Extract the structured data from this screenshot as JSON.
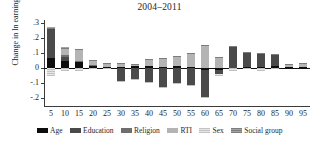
{
  "chart_data": {
    "type": "bar",
    "stacked": true,
    "title": "2004–2011",
    "xlabel": "",
    "ylabel": "Change in ln earnings",
    "categories": [
      "5",
      "10",
      "15",
      "20",
      "25",
      "30",
      "35",
      "40",
      "45",
      "50",
      "55",
      "60",
      "65",
      "70",
      "75",
      "80",
      "85",
      "90",
      "95"
    ],
    "ylim": [
      -0.25,
      0.32
    ],
    "yticks": [
      ".3",
      ".2",
      ".1",
      "0",
      "-.1",
      "-.2"
    ],
    "ytick_values": [
      0.3,
      0.2,
      0.1,
      0,
      -0.1,
      -0.2
    ],
    "grid": false,
    "legend_position": "bottom",
    "series": [
      {
        "name": "Age",
        "color": "#0d0d0d",
        "values": [
          0.065,
          0.045,
          0.04,
          0.02,
          0.008,
          0.006,
          0.014,
          0.018,
          0.011,
          0.013,
          0.01,
          -0.01,
          -0.011,
          0.004,
          0.006,
          0.011,
          0.014,
          0.006,
          0.009
        ]
      },
      {
        "name": "Education",
        "color": "#4a4a4a",
        "values": [
          0.195,
          0.03,
          0.0,
          0.0,
          0.0,
          -0.085,
          -0.068,
          -0.09,
          -0.125,
          -0.095,
          -0.112,
          -0.18,
          -0.03,
          0.142,
          0.096,
          0.084,
          0.077,
          0.0,
          0.0
        ]
      },
      {
        "name": "Religion",
        "color": "#6e6e6e",
        "values": [
          0.0,
          0.012,
          0.008,
          0.004,
          0.0,
          0.0,
          0.0,
          0.0,
          0.0,
          0.0,
          0.0,
          0.0,
          0.0,
          0.0,
          0.0,
          0.0,
          0.0,
          0.0,
          0.0
        ]
      },
      {
        "name": "RTI",
        "color": "#b4b4b4",
        "values": [
          0.0,
          0.04,
          0.072,
          0.028,
          0.02,
          0.026,
          0.01,
          0.04,
          0.056,
          0.062,
          0.085,
          0.15,
          0.068,
          0.0,
          0.0,
          0.0,
          0.0,
          0.02,
          0.02
        ]
      },
      {
        "name": "Sex",
        "color": "#d7d7d7",
        "values": [
          -0.05,
          -0.02,
          -0.018,
          -0.006,
          -0.004,
          -0.005,
          -0.004,
          -0.003,
          -0.003,
          -0.003,
          -0.003,
          -0.01,
          -0.012,
          -0.016,
          -0.004,
          -0.016,
          -0.004,
          0.0,
          0.0
        ]
      },
      {
        "name": "Social group",
        "color": "#8f8f8f",
        "values": [
          0.015,
          0.012,
          0.008,
          0.006,
          0.004,
          0.004,
          0.004,
          0.004,
          0.004,
          0.004,
          0.004,
          0.004,
          0.004,
          0.004,
          0.004,
          0.004,
          0.004,
          0.004,
          0.008
        ]
      }
    ]
  },
  "legend": {
    "items": [
      {
        "label": "Age",
        "key": "age"
      },
      {
        "label": "Education",
        "key": "education"
      },
      {
        "label": "Religion",
        "key": "religion"
      },
      {
        "label": "RTI",
        "key": "rti"
      },
      {
        "label": "Sex",
        "key": "sex"
      },
      {
        "label": "Social group",
        "key": "social"
      }
    ]
  }
}
